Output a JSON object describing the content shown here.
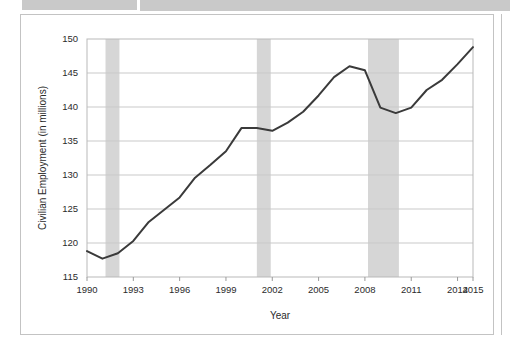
{
  "figure": {
    "background": "#ffffff",
    "frame_color": "#c3c3c3",
    "header_bar_color": "#c9c9c9"
  },
  "chart_data": {
    "type": "line",
    "title": "",
    "subtitle": "",
    "xlabel": "Year",
    "ylabel": "Civilian Employment (in millions)",
    "xlim": [
      1990,
      2015
    ],
    "ylim": [
      115,
      150
    ],
    "grid": true,
    "grid_axis": "y",
    "legend": null,
    "legend_position": "none",
    "line_color": "#3a3a3a",
    "line_width": 2,
    "shade_color": "#d6d6d6",
    "y_ticks": [
      115,
      120,
      125,
      130,
      135,
      140,
      145,
      150
    ],
    "y_tick_labels": [
      "115",
      "120",
      "125",
      "130",
      "135",
      "140",
      "145",
      "150"
    ],
    "x_ticks": [
      1990,
      1993,
      1996,
      1999,
      2002,
      2005,
      2008,
      2011,
      2014,
      2015
    ],
    "x_tick_labels": [
      "1990",
      "1993",
      "1996",
      "1999",
      "2002",
      "2005",
      "2008",
      "2011",
      "2014",
      "2015"
    ],
    "series": [
      {
        "name": "Civilian Employment",
        "x": [
          1990,
          1991,
          1992,
          1993,
          1994,
          1995,
          1996,
          1997,
          1998,
          1999,
          2000,
          2001,
          2002,
          2003,
          2004,
          2005,
          2006,
          2007,
          2008,
          2009,
          2010,
          2011,
          2012,
          2013,
          2014,
          2015
        ],
        "values": [
          118.8,
          117.7,
          118.5,
          120.3,
          123.1,
          124.9,
          126.7,
          129.6,
          131.5,
          133.5,
          136.9,
          136.9,
          136.5,
          137.7,
          139.3,
          141.7,
          144.4,
          146.0,
          145.4,
          139.9,
          139.1,
          139.9,
          142.5,
          144.0,
          146.3,
          148.8
        ],
        "color": "#3a3a3a"
      }
    ],
    "shaded_regions": [
      {
        "label": "recession",
        "x0": 1991.2,
        "x1": 1992.1
      },
      {
        "label": "recession",
        "x0": 2001.0,
        "x1": 2001.9
      },
      {
        "label": "recession",
        "x0": 2008.2,
        "x1": 2010.2
      }
    ]
  }
}
